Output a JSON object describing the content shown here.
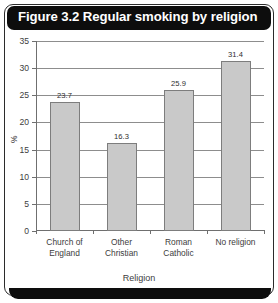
{
  "figure": {
    "title": "Figure 3.2 Regular smoking by religion"
  },
  "chart_data": {
    "type": "bar",
    "title": "Figure 3.2 Regular smoking by religion",
    "categories": [
      "Church of England",
      "Other Christian",
      "Roman Catholic",
      "No religion"
    ],
    "category_lines": [
      [
        "Church of",
        "England"
      ],
      [
        "Other",
        "Christian"
      ],
      [
        "Roman",
        "Catholic"
      ],
      [
        "No religion",
        ""
      ]
    ],
    "values": [
      23.7,
      16.3,
      25.9,
      31.4
    ],
    "value_labels": [
      "23.7",
      "16.3",
      "25.9",
      "31.4"
    ],
    "xlabel": "Religion",
    "ylabel": "%",
    "ylim": [
      0,
      35
    ],
    "yticks": [
      0,
      5,
      10,
      15,
      20,
      25,
      30,
      35
    ],
    "ytick_labels": [
      "0",
      "5",
      "10",
      "15",
      "20",
      "25",
      "30",
      "35"
    ],
    "grid": true,
    "legend": false,
    "bar_fill": "#c9c9c9",
    "bar_border": "#7d7d7d",
    "title_bar_color": "#0d0d0d",
    "title_text_color": "#ffffff"
  }
}
